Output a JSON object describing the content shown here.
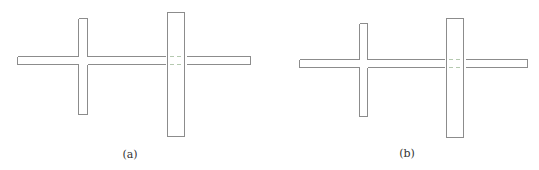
{
  "colors": {
    "line": "#8c8c8c",
    "hidden_line": "#b5c9b0",
    "background": "#ffffff",
    "text": "#333333"
  },
  "subfigures": [
    {
      "label": "(a)",
      "horizontal_bar": {
        "x1": 17,
        "x2": 250,
        "y1": 56,
        "y2": 64
      },
      "small_post": {
        "x1": 78,
        "x2": 87,
        "y1": 18,
        "y2": 114
      },
      "large_post": {
        "x1": 167,
        "x2": 184,
        "y1": 12,
        "y2": 136
      },
      "caption_pos": {
        "x": 130,
        "y": 148
      }
    },
    {
      "label": "(b)",
      "horizontal_bar": {
        "x1": 299,
        "x2": 527,
        "y1": 59,
        "y2": 67
      },
      "small_post": {
        "x1": 359,
        "x2": 367,
        "y1": 23,
        "y2": 116
      },
      "large_post": {
        "x1": 446,
        "x2": 463,
        "y1": 18,
        "y2": 137
      },
      "caption_pos": {
        "x": 407,
        "y": 147
      }
    }
  ]
}
